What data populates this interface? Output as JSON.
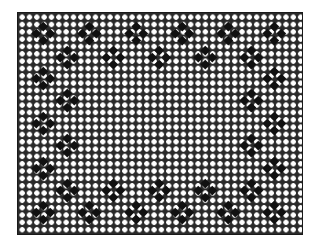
{
  "image": {
    "type": "filet-crochet-lace-pattern",
    "description": "Rectangular diagonal mesh with a border of four-petal diamond motifs",
    "colors": {
      "mesh": "#2a2a2a",
      "holes": "#ffffff",
      "motif": "#111111",
      "background": "#ffffff"
    },
    "frame": {
      "left": 17,
      "top": 12,
      "width": 286,
      "height": 223
    }
  },
  "motifs": [
    {
      "x": 43,
      "y": 33
    },
    {
      "x": 89,
      "y": 33
    },
    {
      "x": 136,
      "y": 33
    },
    {
      "x": 182,
      "y": 33
    },
    {
      "x": 228,
      "y": 33
    },
    {
      "x": 274,
      "y": 33
    },
    {
      "x": 67,
      "y": 57
    },
    {
      "x": 113,
      "y": 57
    },
    {
      "x": 159,
      "y": 57
    },
    {
      "x": 205,
      "y": 57
    },
    {
      "x": 251,
      "y": 57
    },
    {
      "x": 43,
      "y": 78
    },
    {
      "x": 274,
      "y": 78
    },
    {
      "x": 67,
      "y": 100
    },
    {
      "x": 251,
      "y": 100
    },
    {
      "x": 43,
      "y": 123
    },
    {
      "x": 274,
      "y": 123
    },
    {
      "x": 67,
      "y": 145
    },
    {
      "x": 251,
      "y": 145
    },
    {
      "x": 43,
      "y": 168
    },
    {
      "x": 274,
      "y": 168
    },
    {
      "x": 67,
      "y": 190
    },
    {
      "x": 113,
      "y": 190
    },
    {
      "x": 159,
      "y": 190
    },
    {
      "x": 205,
      "y": 190
    },
    {
      "x": 251,
      "y": 190
    },
    {
      "x": 43,
      "y": 212
    },
    {
      "x": 89,
      "y": 212
    },
    {
      "x": 136,
      "y": 212
    },
    {
      "x": 182,
      "y": 212
    },
    {
      "x": 228,
      "y": 212
    },
    {
      "x": 274,
      "y": 212
    }
  ]
}
